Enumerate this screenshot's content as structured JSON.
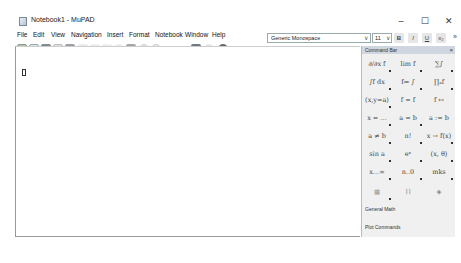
{
  "window": {
    "title": "Notebook1 - MuPAD",
    "controls": {
      "minimize": "–",
      "maximize": "☐",
      "close": "✕"
    }
  },
  "menubar": {
    "items": [
      "File",
      "Edit",
      "View",
      "Navigation",
      "Insert",
      "Format",
      "Notebook",
      "Window",
      "Help"
    ]
  },
  "toolbar": {
    "icons": [
      "new-notebook",
      "new-editor",
      "open",
      "save",
      "print",
      "undo",
      "redo",
      "cut",
      "copy",
      "paste",
      "evaluate",
      "evaluate-all",
      "pi-symbol",
      "format-paragraph",
      "insert-graphic",
      "stop",
      "help",
      "context-help"
    ],
    "font_family": "Generic Monospace",
    "font_size": "11",
    "bold": "B",
    "italic": "I",
    "underline": "U",
    "subscript": "x₂",
    "overflow": "»"
  },
  "editor": {
    "input_marker": "[]"
  },
  "command_bar": {
    "title": "Command Bar",
    "close": "×",
    "cells": [
      "∂/∂x f",
      "lim f",
      "∑∫",
      "∫f dx",
      "f⇒ ∫",
      "∏ₐf",
      "(x,y=a)",
      "f = f",
      "f ↦",
      "x = …",
      "a = b",
      "a := b",
      "a ≠ b",
      "n!",
      "x → f(x)",
      "sin a",
      "eˣ",
      "(x, θ)",
      "x…∞",
      "n..0",
      "mks",
      "▦",
      "⌇⌇",
      "◈"
    ],
    "links": [
      "General Math",
      "Plot Commands"
    ]
  }
}
